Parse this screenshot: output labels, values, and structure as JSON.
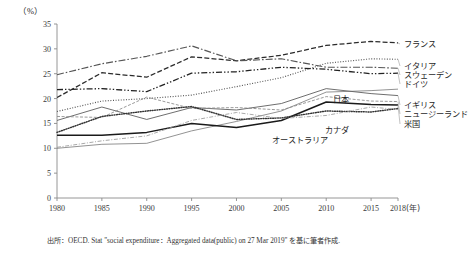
{
  "figure": {
    "unit_label": "（%）",
    "x_axis_unit": "(年)",
    "source_note": "出所：OECD. Stat \"social expenditure：Aggregated data(public) on 27 Mar 2019\" を基に筆者作成."
  },
  "chart_data": {
    "type": "line",
    "title": "",
    "xlabel": "(年)",
    "ylabel": "（%）",
    "xlim": [
      1980,
      2018
    ],
    "ylim": [
      0,
      35
    ],
    "yticks": [
      0,
      5,
      10,
      15,
      20,
      25,
      30,
      35
    ],
    "ytick_labels": [
      "0",
      "5",
      "10",
      "15",
      "20",
      "25",
      "30",
      "35"
    ],
    "xticks": [
      1980,
      1985,
      1990,
      1995,
      2000,
      2005,
      2010,
      2015,
      2018
    ],
    "xtick_labels": [
      "1980",
      "1985",
      "1990",
      "1995",
      "2000",
      "2005",
      "2010",
      "2015",
      "2018"
    ],
    "grid": false,
    "legend_position": "right-inline",
    "x": [
      1980,
      1985,
      1990,
      1995,
      2000,
      2005,
      2010,
      2015,
      2018
    ],
    "series": [
      {
        "name": "フランス",
        "name_en": "France",
        "style": "dashed",
        "values": [
          20.2,
          25.2,
          24.3,
          28.4,
          27.6,
          28.7,
          30.7,
          31.5,
          31.2
        ],
        "label_x": 2018,
        "label_y": 31.2
      },
      {
        "name": "イタリア",
        "name_en": "Italy",
        "style": "dotted",
        "values": [
          17.4,
          19.5,
          20.0,
          20.7,
          22.4,
          24.2,
          27.1,
          28.0,
          27.9
        ],
        "label_x": 2018,
        "label_y": 27.9
      },
      {
        "name": "スウェーデン",
        "name_en": "Sweden",
        "style": "dashdot",
        "values": [
          24.8,
          27.0,
          28.5,
          30.6,
          27.6,
          28.0,
          26.3,
          26.3,
          26.1
        ],
        "label_x": 2018,
        "label_y": 26.1
      },
      {
        "name": "ドイツ",
        "name_en": "Germany",
        "style": "dashdotdot",
        "values": [
          21.8,
          22.0,
          21.4,
          25.1,
          25.4,
          26.3,
          25.9,
          25.0,
          25.1
        ],
        "label_x": 2018,
        "label_y": 25.1
      },
      {
        "name": "日本",
        "name_en": "Japan",
        "style": "solid-thin",
        "values": [
          10.0,
          10.8,
          11.0,
          13.5,
          15.4,
          17.5,
          21.3,
          21.6,
          21.9
        ],
        "label_x": 2009,
        "label_y": 22.6
      },
      {
        "name": "イギリス",
        "name_en": "United Kingdom",
        "style": "solid",
        "values": [
          15.6,
          18.3,
          15.8,
          18.2,
          17.7,
          19.0,
          22.0,
          21.0,
          20.6
        ],
        "label_x": 2018,
        "label_y": 20.6
      },
      {
        "name": "ニュージーランド",
        "name_en": "New Zealand",
        "style": "dashed-fine",
        "values": [
          16.4,
          16.2,
          20.3,
          18.0,
          18.2,
          17.7,
          20.4,
          19.5,
          19.4
        ],
        "label_x": 2018,
        "label_y": 19.4
      },
      {
        "name": "米国",
        "name_en": "United States",
        "style": "solid-bold",
        "values": [
          12.6,
          12.6,
          13.2,
          15.0,
          14.2,
          15.6,
          19.3,
          18.8,
          18.7
        ],
        "label_x": 2018,
        "label_y": 18.7
      },
      {
        "name": "カナダ",
        "name_en": "Canada",
        "style": "dotted-round",
        "values": [
          13.2,
          16.4,
          17.5,
          18.4,
          15.8,
          16.1,
          17.5,
          17.3,
          18.0
        ],
        "label_x": 2014,
        "label_y": 18.4
      },
      {
        "name": "オーストラリア",
        "name_en": "Australia",
        "style": "dashdot-fine",
        "values": [
          10.2,
          11.5,
          12.5,
          15.6,
          17.2,
          16.0,
          16.6,
          18.3,
          17.8
        ],
        "label_x": 2005,
        "label_y": 13.6
      }
    ]
  },
  "legend": {
    "right_items": [
      {
        "label": "フランス",
        "top": 40
      },
      {
        "label": "イタリア",
        "top": 62
      },
      {
        "label": "スウェーデン",
        "top": 71
      },
      {
        "label": "ドイツ",
        "top": 80
      },
      {
        "label": "イギリス",
        "top": 101
      },
      {
        "label": "ニュージーランド",
        "top": 110
      },
      {
        "label": "米国",
        "top": 120
      }
    ],
    "inline_items": [
      {
        "label": "日本",
        "left": 333,
        "top": 95
      },
      {
        "label": "カナダ",
        "left": 325,
        "top": 126
      },
      {
        "label": "オーストラリア",
        "left": 272,
        "top": 136
      }
    ]
  }
}
